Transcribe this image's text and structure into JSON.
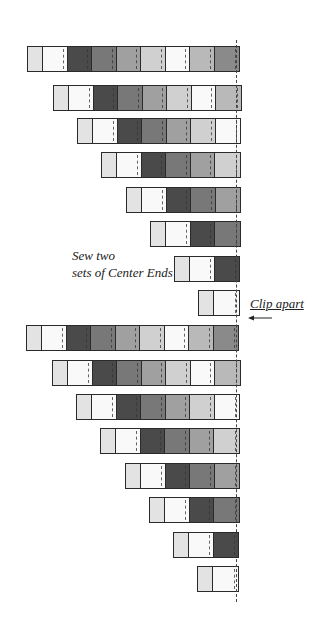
{
  "diagram": {
    "palette": {
      "L": "#e3e3e3",
      "W": "#f9f9f9",
      "D": "#4a4a4a",
      "DG": "#787878",
      "G": "#a0a0a0",
      "LT": "#d0d0d0",
      "LM": "#b9b9b9",
      "M": "#8a8a8a"
    },
    "cell_width": 24.5,
    "first_cell_width": 15,
    "clip_line_x": 236,
    "rows": [
      {
        "x": 27,
        "y": 46,
        "cells": [
          "L",
          "W",
          "D",
          "DG",
          "G",
          "LT",
          "W",
          "LM",
          "M"
        ]
      },
      {
        "x": 53,
        "y": 85,
        "cells": [
          "L",
          "W",
          "D",
          "DG",
          "G",
          "LT",
          "W",
          "LM"
        ]
      },
      {
        "x": 77,
        "y": 118,
        "cells": [
          "L",
          "W",
          "D",
          "DG",
          "G",
          "LT",
          "W"
        ]
      },
      {
        "x": 101,
        "y": 152,
        "cells": [
          "L",
          "W",
          "D",
          "DG",
          "G",
          "LT"
        ]
      },
      {
        "x": 126,
        "y": 187,
        "cells": [
          "L",
          "W",
          "D",
          "DG",
          "G"
        ]
      },
      {
        "x": 150,
        "y": 221,
        "cells": [
          "L",
          "W",
          "D",
          "DG"
        ]
      },
      {
        "x": 174,
        "y": 256,
        "cells": [
          "L",
          "W",
          "D"
        ]
      },
      {
        "x": 198,
        "y": 290,
        "cells": [
          "L",
          "W"
        ]
      },
      {
        "x": 26,
        "y": 325,
        "cells": [
          "L",
          "W",
          "D",
          "DG",
          "G",
          "LT",
          "W",
          "LM",
          "M"
        ]
      },
      {
        "x": 52,
        "y": 360,
        "cells": [
          "L",
          "W",
          "D",
          "DG",
          "G",
          "LT",
          "W",
          "LM"
        ]
      },
      {
        "x": 76,
        "y": 394,
        "cells": [
          "L",
          "W",
          "D",
          "DG",
          "G",
          "LT",
          "W"
        ]
      },
      {
        "x": 100,
        "y": 428,
        "cells": [
          "L",
          "W",
          "D",
          "DG",
          "G",
          "LT"
        ]
      },
      {
        "x": 125,
        "y": 463,
        "cells": [
          "L",
          "W",
          "D",
          "DG",
          "G"
        ]
      },
      {
        "x": 149,
        "y": 497,
        "cells": [
          "L",
          "W",
          "D",
          "DG"
        ]
      },
      {
        "x": 173,
        "y": 532,
        "cells": [
          "L",
          "W",
          "D"
        ]
      },
      {
        "x": 197,
        "y": 566,
        "cells": [
          "L",
          "W"
        ]
      }
    ],
    "notes": {
      "sew_line1": "Sew two",
      "sew_line2": "sets of Center Ends",
      "clip": "Clip apart"
    }
  }
}
